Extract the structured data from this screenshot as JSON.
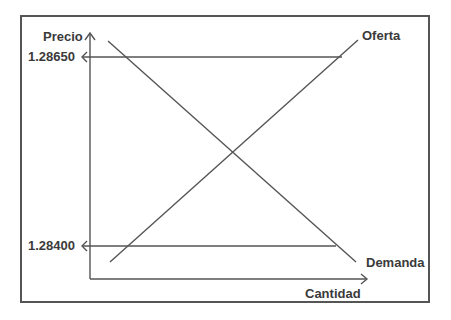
{
  "diagram": {
    "type": "supply-demand",
    "y_axis_label": "Precio",
    "x_axis_label": "Cantidad",
    "curves": {
      "supply_label": "Oferta",
      "demand_label": "Demanda"
    },
    "price_levels": {
      "high": "1.28650",
      "low": "1.28400"
    },
    "colors": {
      "line": "#555555",
      "text": "#3a3a3a",
      "background": "#ffffff"
    }
  }
}
